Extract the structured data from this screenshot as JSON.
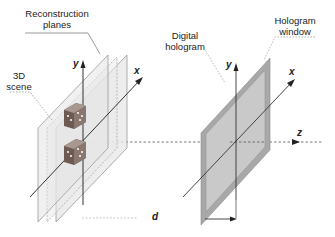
{
  "diagram": {
    "labels": {
      "reconstruction_planes_line1": "Reconstruction",
      "reconstruction_planes_line2": "planes",
      "scene_line1": "3D",
      "scene_line2": "scene",
      "hologram_line1": "Digital",
      "hologram_line2": "hologram",
      "window_line1": "Hologram",
      "window_line2": "window",
      "distance": "d"
    },
    "axes": {
      "scene_y": "y",
      "scene_x": "x",
      "holo_y": "y",
      "holo_x": "x",
      "z": "z"
    },
    "colors": {
      "plane_fill": "#e6e6e6",
      "plane_stroke": "#9a9a9a",
      "hologram_frame": "#a8a8a8",
      "hologram_inner": "#c8c8c8",
      "axis": "#222222",
      "dice": "#6d5a52"
    },
    "elements": {
      "reconstruction_plane_count": 3,
      "dice_count": 2
    }
  }
}
